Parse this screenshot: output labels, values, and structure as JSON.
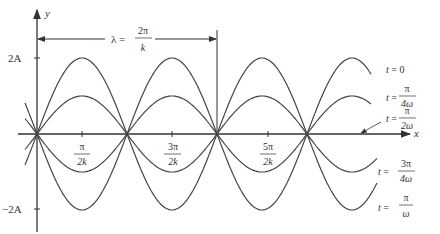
{
  "diagram": {
    "axes": {
      "x_label": "x",
      "y_label": "y"
    },
    "y_ticks": [
      {
        "label": "2A",
        "value": 2
      },
      {
        "label": "−2A",
        "value": -2
      }
    ],
    "x_ticks": [
      {
        "num": "π",
        "den": "2k"
      },
      {
        "num": "3π",
        "den": "2k"
      },
      {
        "num": "5π",
        "den": "2k"
      }
    ],
    "wavelength": {
      "lhs": "λ =",
      "num": "2π",
      "den": "k"
    },
    "curves": [
      {
        "label_lhs": "t =",
        "label_value": "0",
        "amplitude_rel": 1.0
      },
      {
        "label_lhs": "t =",
        "label_num": "π",
        "label_den": "4ω",
        "amplitude_rel": 0.5
      },
      {
        "label_lhs": "t =",
        "label_num": "π",
        "label_den": "2ω",
        "amplitude_rel": 0.0
      },
      {
        "label_lhs": "t =",
        "label_num": "3π",
        "label_den": "4ω",
        "amplitude_rel": -0.5
      },
      {
        "label_lhs": "t =",
        "label_num": "π",
        "label_den": "ω",
        "amplitude_rel": -1.0
      }
    ],
    "line_color": "#444444"
  }
}
